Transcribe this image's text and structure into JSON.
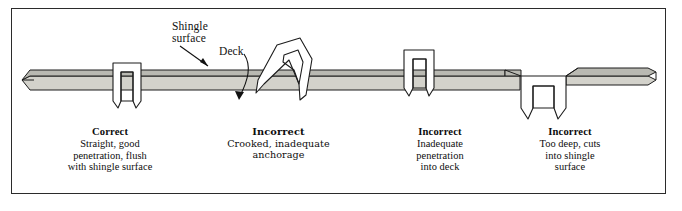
{
  "figure": {
    "border_color": "#2b2b2b",
    "background_color": "#ffffff"
  },
  "colors": {
    "shingle_fill": "#b9b9b2",
    "deck_fill": "#d3d2cb",
    "outline": "#1c1c1c",
    "text": "#0d0d0d"
  },
  "callouts": [
    {
      "id": "shingle-surface",
      "label": "Shingle\nsurface",
      "points_to": "shingle-layer"
    },
    {
      "id": "deck",
      "label": "Deck",
      "points_to": "deck-layer"
    }
  ],
  "captions": [
    {
      "heading": "Correct",
      "body": "Straight, good\npenetration, flush\nwith shingle surface"
    },
    {
      "heading": "Incorrect",
      "body": "Crooked, inadequate\nanchorage"
    },
    {
      "heading": "Incorrect",
      "body": "Inadequate\npenetration\ninto deck"
    },
    {
      "heading": "Incorrect",
      "body": "Too deep, cuts\ninto shingle\nsurface"
    }
  ],
  "staples": [
    {
      "id": "staple-correct",
      "condition": "correct",
      "description": "Straight staple, crown flush with shingle surface, legs fully through deck"
    },
    {
      "id": "staple-crooked",
      "condition": "incorrect",
      "description": "Tilted staple, crooked and inadequately anchored"
    },
    {
      "id": "staple-shallow",
      "condition": "incorrect",
      "description": "Staple sitting high, legs stop short inside the deck"
    },
    {
      "id": "staple-overdriven",
      "condition": "incorrect",
      "description": "Staple driven too deep, crown cuts below shingle surface"
    }
  ],
  "layers": [
    {
      "id": "shingle-layer",
      "name": "Shingle surface"
    },
    {
      "id": "deck-layer",
      "name": "Deck"
    }
  ]
}
